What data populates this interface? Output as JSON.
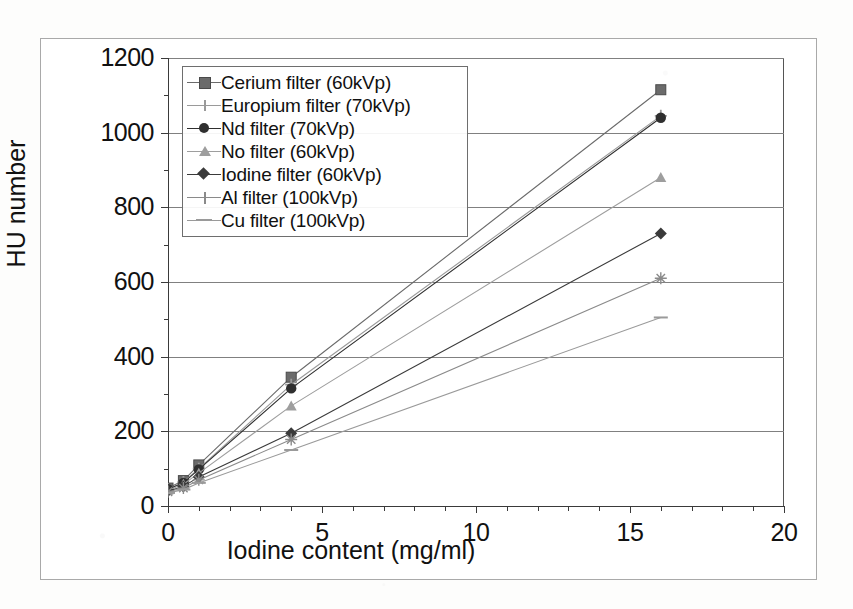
{
  "chart_data": {
    "type": "line",
    "title": "",
    "xlabel": "Iodine content (mg/ml)",
    "ylabel": "HU number",
    "xlim": [
      0,
      20
    ],
    "ylim": [
      0,
      1200
    ],
    "xticks": [
      0,
      5,
      10,
      15,
      20
    ],
    "yticks": [
      0,
      200,
      400,
      600,
      800,
      1000,
      1200
    ],
    "x_minor_step": 1,
    "y_minor_step": 100,
    "grid": "horizontal",
    "legend_position": "upper-left-inside",
    "x": [
      0,
      0.5,
      1,
      4,
      16
    ],
    "series": [
      {
        "name": "Cerium filter (60kVp)",
        "marker": "square",
        "color": "#6b6b6b",
        "values": [
          48,
          68,
          110,
          345,
          1115
        ]
      },
      {
        "name": "Europium filter (70kVp)",
        "marker": "plus",
        "color": "#9a9a9a",
        "values": [
          45,
          64,
          100,
          325,
          1045
        ]
      },
      {
        "name": "Nd filter (70kVp)",
        "marker": "circle",
        "color": "#2f2f2f",
        "values": [
          45,
          62,
          98,
          315,
          1040
        ]
      },
      {
        "name": "No filter (60kVp)",
        "marker": "triangle",
        "color": "#9e9e9e",
        "values": [
          42,
          58,
          88,
          268,
          880
        ]
      },
      {
        "name": "Iodine filter (60kVp)",
        "marker": "diamond",
        "color": "#3a3a3a",
        "values": [
          40,
          52,
          78,
          195,
          730
        ]
      },
      {
        "name": "Al filter (100kVp)",
        "marker": "star",
        "color": "#8a8a8a",
        "values": [
          38,
          48,
          70,
          178,
          610
        ]
      },
      {
        "name": "Cu filter (100kVp)",
        "marker": "dash",
        "color": "#9a9a9a",
        "values": [
          35,
          44,
          62,
          150,
          505
        ]
      }
    ]
  },
  "axes": {
    "y_tick_labels": [
      "1200",
      "1000",
      "800",
      "600",
      "400",
      "200",
      "0"
    ],
    "x_tick_labels": [
      "0",
      "5",
      "10",
      "15",
      "20"
    ],
    "y_title": "HU number",
    "x_title": "Iodine content (mg/ml)"
  },
  "legend": {
    "items": [
      {
        "label": "Cerium filter (60kVp)",
        "marker": "square"
      },
      {
        "label": "Europium filter (70kVp)",
        "marker": "plus"
      },
      {
        "label": "Nd filter (70kVp)",
        "marker": "circle"
      },
      {
        "label": "No filter (60kVp)",
        "marker": "triangle"
      },
      {
        "label": "Iodine filter (60kVp)",
        "marker": "diamond"
      },
      {
        "label": "Al filter (100kVp)",
        "marker": "star"
      },
      {
        "label": "Cu filter (100kVp)",
        "marker": "dash"
      }
    ]
  }
}
